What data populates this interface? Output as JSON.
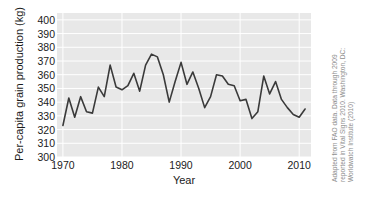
{
  "chart_data": {
    "type": "line",
    "title": "",
    "xlabel": "Year",
    "ylabel": "Per-capita grain production (kg)",
    "xlim": [
      1969,
      2012
    ],
    "ylim": [
      300,
      405
    ],
    "xticks": [
      1970,
      1980,
      1990,
      2000,
      2010
    ],
    "yticks": [
      300,
      310,
      320,
      330,
      340,
      350,
      360,
      370,
      380,
      390,
      400
    ],
    "grid": true,
    "legend": null,
    "line_color": "#3a3a3a",
    "plot_background": "#e8e8e8",
    "x": [
      1970,
      1971,
      1972,
      1973,
      1974,
      1975,
      1976,
      1977,
      1978,
      1979,
      1980,
      1981,
      1982,
      1983,
      1984,
      1985,
      1986,
      1987,
      1988,
      1989,
      1990,
      1991,
      1992,
      1993,
      1994,
      1995,
      1996,
      1997,
      1998,
      1999,
      2000,
      2001,
      2002,
      2003,
      2004,
      2005,
      2006,
      2007,
      2008,
      2009,
      2010,
      2011
    ],
    "values": [
      323,
      343,
      329,
      344,
      333,
      332,
      351,
      344,
      367,
      351,
      349,
      352,
      361,
      348,
      367,
      375,
      373,
      360,
      340,
      355,
      369,
      353,
      362,
      350,
      336,
      344,
      360,
      359,
      353,
      352,
      341,
      342,
      328,
      333,
      359,
      346,
      355,
      342,
      336,
      331,
      329,
      335
    ],
    "series": [
      {
        "name": "Per-capita grain production",
        "values": [
          323,
          343,
          329,
          344,
          333,
          332,
          351,
          344,
          367,
          351,
          349,
          352,
          361,
          348,
          367,
          375,
          373,
          360,
          340,
          355,
          369,
          353,
          362,
          350,
          336,
          344,
          360,
          359,
          353,
          352,
          341,
          342,
          328,
          333,
          359,
          346,
          355,
          342,
          336,
          331,
          329,
          335
        ]
      }
    ]
  },
  "axes": {
    "ylabel": "Per-capita grain production (kg)",
    "xlabel": "Year",
    "ytick_labels": [
      "400",
      "390",
      "380",
      "370",
      "360",
      "350",
      "340",
      "330",
      "320",
      "310",
      "300"
    ],
    "xtick_labels": [
      "1970",
      "1980",
      "1990",
      "2000",
      "2010"
    ]
  },
  "credit": {
    "line1": "Adapted from FAO data. Data through 2009",
    "line2": "reported in Vital Signs 2010. Washington, DC:",
    "line3": "Worldwatch Institute (2010)"
  }
}
